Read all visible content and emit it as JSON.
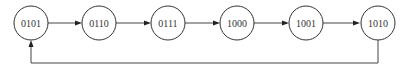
{
  "diagram": {
    "type": "state-transition",
    "states": [
      {
        "id": "s0",
        "label": "0101",
        "cx": 31,
        "cy": 23
      },
      {
        "id": "s1",
        "label": "0110",
        "cx": 99,
        "cy": 23
      },
      {
        "id": "s2",
        "label": "0111",
        "cx": 168,
        "cy": 23
      },
      {
        "id": "s3",
        "label": "1000",
        "cx": 237,
        "cy": 23
      },
      {
        "id": "s4",
        "label": "1001",
        "cx": 306,
        "cy": 23
      },
      {
        "id": "s5",
        "label": "1010",
        "cx": 377,
        "cy": 23
      }
    ],
    "transitions": [
      {
        "from": "0101",
        "to": "0110"
      },
      {
        "from": "0110",
        "to": "0111"
      },
      {
        "from": "0111",
        "to": "1000"
      },
      {
        "from": "1000",
        "to": "1001"
      },
      {
        "from": "1001",
        "to": "1010"
      },
      {
        "from": "1010",
        "to": "0101",
        "style": "feedback-loop-below"
      }
    ],
    "colors": {
      "stroke": "#333333",
      "background": "#ffffff"
    }
  }
}
